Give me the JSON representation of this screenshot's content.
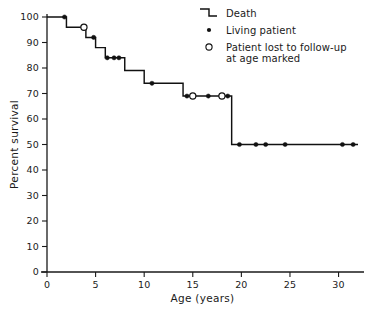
{
  "chart_data": {
    "type": "line",
    "subtype": "kaplan-meier-step",
    "title": "",
    "xlabel": "Age (years)",
    "ylabel": "Percent survival",
    "xlim": [
      0,
      32
    ],
    "ylim": [
      0,
      100
    ],
    "grid": false,
    "xticks": [
      0,
      5,
      10,
      15,
      20,
      25,
      30
    ],
    "xtick_labels": [
      "0",
      "5",
      "10",
      "15",
      "20",
      "25",
      "30"
    ],
    "yticks": [
      0,
      10,
      20,
      30,
      40,
      50,
      60,
      70,
      80,
      90,
      100
    ],
    "ytick_labels": [
      "0",
      "10",
      "20",
      "30",
      "40",
      "50",
      "60",
      "70",
      "80",
      "90",
      "100"
    ],
    "legend_position": "top-right",
    "series": [
      {
        "name": "Death",
        "style": "step",
        "x": [
          0.0,
          2.0,
          2.0,
          4.0,
          4.0,
          5.0,
          5.0,
          6.0,
          6.0,
          8.0,
          8.0,
          10.0,
          10.0,
          14.0,
          14.0,
          19.0,
          19.0,
          32.0
        ],
        "y": [
          100.0,
          100.0,
          96.0,
          96.0,
          92.0,
          92.0,
          88.0,
          88.0,
          84.0,
          84.0,
          79.0,
          79.0,
          74.0,
          74.0,
          69.0,
          69.0,
          50.0,
          50.0
        ]
      }
    ],
    "living_patients": [
      {
        "x": 1.8,
        "y": 100.0
      },
      {
        "x": 4.8,
        "y": 92.0
      },
      {
        "x": 6.2,
        "y": 84.0
      },
      {
        "x": 6.9,
        "y": 84.0
      },
      {
        "x": 7.4,
        "y": 84.0
      },
      {
        "x": 10.8,
        "y": 74.0
      },
      {
        "x": 14.4,
        "y": 69.0
      },
      {
        "x": 16.6,
        "y": 69.0
      },
      {
        "x": 18.6,
        "y": 69.0
      },
      {
        "x": 19.8,
        "y": 50.0
      },
      {
        "x": 21.5,
        "y": 50.0
      },
      {
        "x": 22.5,
        "y": 50.0
      },
      {
        "x": 24.5,
        "y": 50.0
      },
      {
        "x": 30.4,
        "y": 50.0
      },
      {
        "x": 31.5,
        "y": 50.0
      }
    ],
    "lost_to_followup": [
      {
        "x": 3.8,
        "y": 96.0
      },
      {
        "x": 15.0,
        "y": 69.0
      },
      {
        "x": 18.0,
        "y": 69.0
      }
    ]
  },
  "legend": {
    "items": [
      {
        "key": "death",
        "label": "Death",
        "marker": "step-icon"
      },
      {
        "key": "living",
        "label": "Living patient",
        "marker": "filled-dot-icon"
      },
      {
        "key": "lost",
        "label": "Patient lost to follow-up",
        "label_line2": "at age marked",
        "marker": "open-circle-icon"
      }
    ]
  },
  "colors": {
    "ink": "#111111",
    "axis": "#1a1a1a",
    "background": "#ffffff"
  }
}
